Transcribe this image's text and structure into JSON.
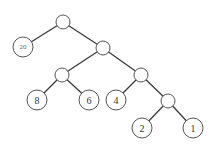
{
  "diagram": {
    "type": "binary-tree",
    "nodes": [
      {
        "id": "root",
        "label": "",
        "x": 63,
        "y": 22,
        "r": 7
      },
      {
        "id": "n20",
        "label": "20",
        "x": 23,
        "y": 47,
        "r": 10
      },
      {
        "id": "a",
        "label": "",
        "x": 103,
        "y": 48,
        "r": 7
      },
      {
        "id": "b",
        "label": "",
        "x": 62,
        "y": 75,
        "r": 7
      },
      {
        "id": "c",
        "label": "",
        "x": 141,
        "y": 75,
        "r": 7
      },
      {
        "id": "n8",
        "label": "8",
        "x": 37,
        "y": 100,
        "r": 10
      },
      {
        "id": "n6",
        "label": "6",
        "x": 89,
        "y": 100,
        "r": 10
      },
      {
        "id": "n4",
        "label": "4",
        "x": 116,
        "y": 100,
        "r": 10
      },
      {
        "id": "d",
        "label": "",
        "x": 168,
        "y": 101,
        "r": 7
      },
      {
        "id": "n2",
        "label": "2",
        "x": 142,
        "y": 128,
        "r": 10
      },
      {
        "id": "n1",
        "label": "1",
        "x": 193,
        "y": 128,
        "r": 10
      }
    ],
    "edges": [
      [
        "root",
        "n20"
      ],
      [
        "root",
        "a"
      ],
      [
        "a",
        "b"
      ],
      [
        "a",
        "c"
      ],
      [
        "b",
        "n8"
      ],
      [
        "b",
        "n6"
      ],
      [
        "c",
        "n4"
      ],
      [
        "c",
        "d"
      ],
      [
        "d",
        "n2"
      ],
      [
        "d",
        "n1"
      ]
    ],
    "leaf_labels": {
      "n20": "20",
      "n8": "8",
      "n6": "6",
      "n4": "4",
      "n2": "2",
      "n1": "1"
    }
  }
}
